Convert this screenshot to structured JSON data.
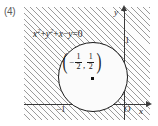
{
  "problem": {
    "number": "(4)"
  },
  "figure": {
    "equation": {
      "x_term": "x",
      "x_exp": "2",
      "plus_1": "+",
      "y_term": "y",
      "y_exp": "2",
      "plus_2": "+",
      "x_linear": "x",
      "minus": "−",
      "y_linear": "y",
      "equals": "=",
      "zero": "0",
      "full_text": "x² + y² + x − y = 0"
    },
    "center_label": {
      "open_paren": "(",
      "neg_sign": "−",
      "x_num": "1",
      "x_den": "2",
      "comma": ",",
      "y_num": "1",
      "y_den": "2",
      "close_paren": ")",
      "full_text": "(−1/2, 1/2)"
    },
    "axes": {
      "x_name": "x",
      "y_name": "y",
      "origin": "O"
    },
    "ticks": {
      "x_neg_one": "−1",
      "y_one": "1"
    },
    "colors": {
      "curve": "#1a1a1a",
      "axis": "#3a3a3a",
      "hatch": "#9a9a9a",
      "background": "#ffffff"
    }
  },
  "chart_data": {
    "type": "scatter",
    "title": "",
    "xlabel": "x",
    "ylabel": "y",
    "xlim": [
      -1.6,
      0.45
    ],
    "ylim": [
      -0.55,
      1.55
    ],
    "grid": false,
    "legend": null,
    "annotations": [
      "x^2 + y^2 + x - y = 0",
      "(-1/2, 1/2)"
    ],
    "shapes": [
      {
        "kind": "circle",
        "equation": "x^2 + y^2 + x - y = 0",
        "center": [
          -0.5,
          0.5
        ],
        "radius": 0.7071,
        "fill": "unshaded",
        "stroke": "#1a1a1a"
      }
    ],
    "shaded_region": {
      "description": "exterior of the circle is hatched",
      "hatch_angle_deg": 45
    },
    "points": [
      {
        "x": -0.5,
        "y": 0.5,
        "label": "center",
        "marker": "square"
      }
    ],
    "xticks": [
      -1,
      0
    ],
    "xticklabels": [
      "−1",
      "O"
    ],
    "yticks": [
      1
    ],
    "yticklabels": [
      "1"
    ]
  }
}
